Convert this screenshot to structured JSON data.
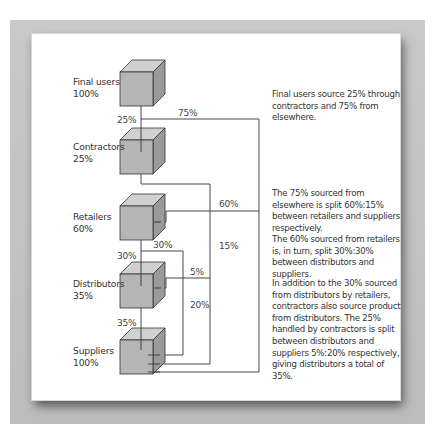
{
  "figure": {
    "type": "supply-chain-flow-diagram",
    "nodes": [
      {
        "name": "Final users",
        "share": "100%"
      },
      {
        "name": "Contractors",
        "share": "25%"
      },
      {
        "name": "Retailers",
        "share": "60%"
      },
      {
        "name": "Distributors",
        "share": "35%"
      },
      {
        "name": "Suppliers",
        "share": "100%"
      }
    ],
    "flow_labels": {
      "final_to_contractors": "25%",
      "final_elsewhere": "75%",
      "elsewhere_to_retailers": "60%",
      "elsewhere_to_suppliers": "15%",
      "retailers_to_distributors": "30%",
      "retailers_to_suppliers": "30%",
      "contractors_to_distributors": "5%",
      "contractors_to_suppliers": "20%",
      "distributors_to_suppliers": "35%"
    },
    "notes": [
      "Final users source 25% through contractors and 75% from elsewhere.",
      "The 75% sourced from elsewhere is split 60%:15% between retailers and suppliers respectively.",
      "The 60% sourced from retailers is, in turn, split 30%:30% between distributors and suppliers.",
      "In addition to the 30% sourced from distributors by retailers, contractors also source product from distributors. The 25% handled by contractors is split between distributors and suppliers 5%:20% respectively, giving distributors a total of 35%."
    ]
  },
  "colors": {
    "cube_front": "#b4b4b4",
    "cube_top": "#cfcfcf",
    "cube_side": "#999999",
    "line": "#333333",
    "backdrop": "#c4c4c4"
  }
}
